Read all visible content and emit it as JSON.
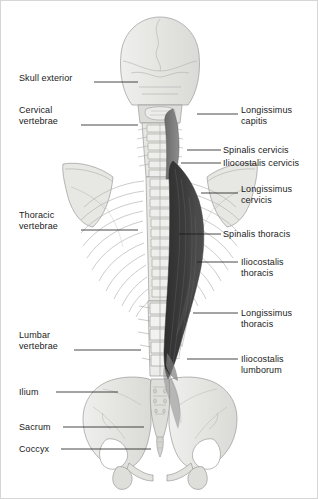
{
  "figure": {
    "view": "posterior",
    "background_color": "#ffffff",
    "border_color": "#d6d6d6",
    "bone_fill_color": "#e9e9e7",
    "bone_outline_color": "#9a9a98",
    "muscle_dark_color": "#3a3a3a",
    "muscle_mid_color": "#6e6e6e",
    "leader_line_color": "#1a1a1a",
    "text_color": "#1a1a1a"
  },
  "labels_left": [
    {
      "id": "skull-exterior",
      "lines": [
        "Skull exterior"
      ],
      "text_x": 18,
      "text_y": 72,
      "leader": {
        "x1": 93,
        "y1": 81,
        "x2": 137,
        "y2": 81
      }
    },
    {
      "id": "cervical-vertebrae",
      "lines": [
        "Cervical",
        "vertebrae"
      ],
      "text_x": 18,
      "text_y": 104,
      "leader": {
        "x1": 80,
        "y1": 124,
        "x2": 137,
        "y2": 124
      }
    },
    {
      "id": "thoracic-vertebrae",
      "lines": [
        "Thoracic",
        "vertebrae"
      ],
      "text_x": 18,
      "text_y": 209,
      "leader": {
        "x1": 80,
        "y1": 229,
        "x2": 137,
        "y2": 229
      }
    },
    {
      "id": "lumbar-vertebrae",
      "lines": [
        "Lumbar",
        "vertebrae"
      ],
      "text_x": 18,
      "text_y": 329,
      "leader": {
        "x1": 73,
        "y1": 349,
        "x2": 140,
        "y2": 349
      }
    },
    {
      "id": "ilium",
      "lines": [
        "Ilium"
      ],
      "text_x": 18,
      "text_y": 386,
      "leader": {
        "x1": 55,
        "y1": 391,
        "x2": 117,
        "y2": 391
      }
    },
    {
      "id": "sacrum",
      "lines": [
        "Sacrum"
      ],
      "text_x": 18,
      "text_y": 421,
      "leader": {
        "x1": 62,
        "y1": 426,
        "x2": 143,
        "y2": 426
      }
    },
    {
      "id": "coccyx",
      "lines": [
        "Coccyx"
      ],
      "text_x": 18,
      "text_y": 443,
      "leader": {
        "x1": 60,
        "y1": 448,
        "x2": 150,
        "y2": 448
      }
    }
  ],
  "labels_right": [
    {
      "id": "longissimus-capitis",
      "lines": [
        "Longissimus",
        "capitis"
      ],
      "text_x": 240,
      "text_y": 104,
      "leader": {
        "x1": 196,
        "y1": 113,
        "x2": 237,
        "y2": 113
      }
    },
    {
      "id": "spinalis-cervicis",
      "lines": [
        "Spinalis cervicis"
      ],
      "text_x": 222,
      "text_y": 144,
      "leader": {
        "x1": 186,
        "y1": 149,
        "x2": 220,
        "y2": 149
      }
    },
    {
      "id": "iliocostalis-cervicis",
      "lines": [
        "Iliocostalis cervicis"
      ],
      "text_x": 222,
      "text_y": 157,
      "leader": {
        "x1": 180,
        "y1": 162,
        "x2": 220,
        "y2": 162
      }
    },
    {
      "id": "longissimus-cervicis",
      "lines": [
        "Longissimus",
        "cervicis"
      ],
      "text_x": 240,
      "text_y": 183,
      "leader": {
        "x1": 200,
        "y1": 192,
        "x2": 237,
        "y2": 192
      }
    },
    {
      "id": "spinalis-thoracis",
      "lines": [
        "Spinalis thoracis"
      ],
      "text_x": 222,
      "text_y": 228,
      "leader": {
        "x1": 178,
        "y1": 233,
        "x2": 220,
        "y2": 233
      }
    },
    {
      "id": "iliocostalis-thoracis",
      "lines": [
        "Iliocostalis",
        "thoracis"
      ],
      "text_x": 240,
      "text_y": 256,
      "leader": {
        "x1": 196,
        "y1": 261,
        "x2": 237,
        "y2": 261
      }
    },
    {
      "id": "longissimus-thoracis",
      "lines": [
        "Longissimus",
        "thoracis"
      ],
      "text_x": 240,
      "text_y": 307,
      "leader": {
        "x1": 192,
        "y1": 312,
        "x2": 237,
        "y2": 312
      }
    },
    {
      "id": "iliocostalis-lumborum",
      "lines": [
        "Iliocostalis",
        "lumborum"
      ],
      "text_x": 240,
      "text_y": 353,
      "leader": {
        "x1": 186,
        "y1": 358,
        "x2": 237,
        "y2": 358
      }
    }
  ]
}
